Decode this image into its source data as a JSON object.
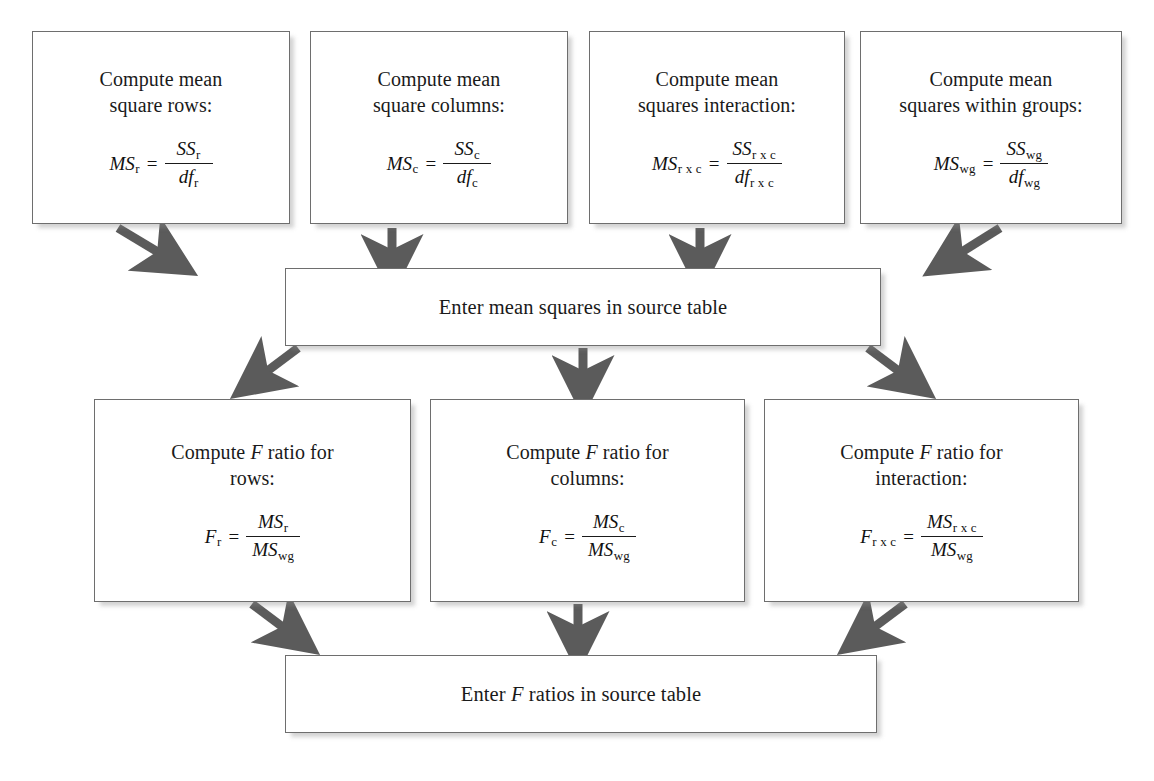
{
  "diagram": {
    "type": "flowchart",
    "title_partial": "Figure: Two-way ANOVA computation (continued)",
    "arrow_color": "#5b5b5b",
    "box_border_color": "#6e6e6e",
    "background_color": "#ffffff",
    "text_color": "#1a1a1a"
  },
  "row1": {
    "boxes": [
      {
        "id": "mean-square-rows",
        "line1": "Compute mean",
        "line2": "square rows:",
        "formula": {
          "lhs_base": "MS",
          "lhs_sub": "r",
          "equals": "=",
          "num_base": "SS",
          "num_sub": "r",
          "den_base": "df",
          "den_sub": "r"
        }
      },
      {
        "id": "mean-square-columns",
        "line1": "Compute mean",
        "line2": "square columns:",
        "formula": {
          "lhs_base": "MS",
          "lhs_sub": "c",
          "equals": "=",
          "num_base": "SS",
          "num_sub": "c",
          "den_base": "df",
          "den_sub": "c"
        }
      },
      {
        "id": "mean-squares-interaction",
        "line1": "Compute mean",
        "line2": "squares interaction:",
        "formula": {
          "lhs_base": "MS",
          "lhs_sub": "r x c",
          "equals": "=",
          "num_base": "SS",
          "num_sub": "r x c",
          "den_base": "df",
          "den_sub": "r x c"
        }
      },
      {
        "id": "mean-squares-within-groups",
        "line1": "Compute mean",
        "line2": "squares within groups:",
        "formula": {
          "lhs_base": "MS",
          "lhs_sub": "wg",
          "equals": "=",
          "num_base": "SS",
          "num_sub": "wg",
          "den_base": "df",
          "den_sub": "wg"
        }
      }
    ]
  },
  "middle": {
    "label": "Enter mean squares in source table"
  },
  "row2": {
    "boxes": [
      {
        "id": "f-ratio-rows",
        "pre": "Compute ",
        "ital": "F",
        "post": " ratio for",
        "line2": "rows:",
        "formula": {
          "lhs_base": "F",
          "lhs_sub": "r",
          "equals": "=",
          "num_base": "MS",
          "num_sub": "r",
          "den_base": "MS",
          "den_sub": "wg"
        }
      },
      {
        "id": "f-ratio-columns",
        "pre": "Compute ",
        "ital": "F",
        "post": " ratio for",
        "line2": "columns:",
        "formula": {
          "lhs_base": "F",
          "lhs_sub": "c",
          "equals": "=",
          "num_base": "MS",
          "num_sub": "c",
          "den_base": "MS",
          "den_sub": "wg"
        }
      },
      {
        "id": "f-ratio-interaction",
        "pre": "Compute ",
        "ital": "F",
        "post": " ratio for",
        "line2": "interaction:",
        "formula": {
          "lhs_base": "F",
          "lhs_sub": "r x c",
          "equals": "=",
          "num_base": "MS",
          "num_sub": "r x c",
          "den_base": "MS",
          "den_sub": "wg"
        }
      }
    ]
  },
  "bottom": {
    "pre": "Enter ",
    "ital": "F",
    "post": " ratios in source table"
  }
}
